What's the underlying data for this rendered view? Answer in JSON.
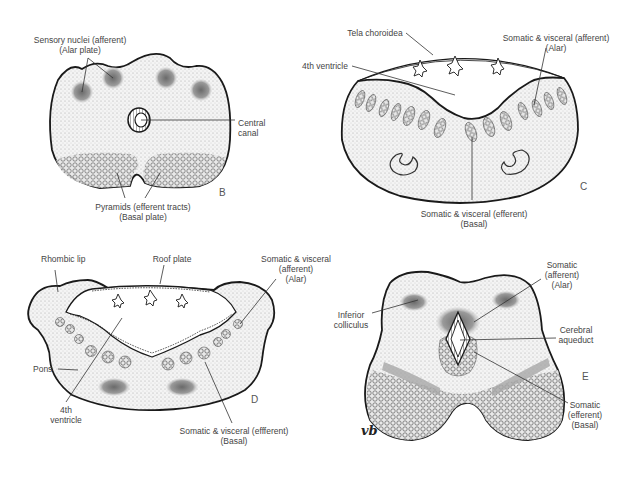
{
  "panels": {
    "B": {
      "letter": "B",
      "labels": {
        "sensory_line1": "Sensory nuclei (afferent)",
        "sensory_line2": "(Alar plate)",
        "central_line1": "Central",
        "central_line2": "canal",
        "pyramids_line1": "Pyramids (efferent tracts)",
        "pyramids_line2": "(Basal plate)"
      }
    },
    "C": {
      "letter": "C",
      "labels": {
        "tela": "Tela choroidea",
        "ventricle": "4th ventricle",
        "afferent_line1": "Somatic & visceral (afferent)",
        "afferent_line2": "(Alar)",
        "efferent_line1": "Somatic & visceral (efferent)",
        "efferent_line2": "(Basal)"
      }
    },
    "D": {
      "letter": "D",
      "labels": {
        "rhombic": "Rhombic lip",
        "roof": "Roof plate",
        "afferent_line1": "Somatic & visceral",
        "afferent_line2": "(afferent)",
        "afferent_line3": "(Alar)",
        "pons": "Pons",
        "ventricle_line1": "4th",
        "ventricle_line2": "ventricle",
        "efferent_line1": "Somatic & visceral (effferent)",
        "efferent_line2": "(Basal)"
      }
    },
    "E": {
      "letter": "E",
      "labels": {
        "afferent_line1": "Somatic",
        "afferent_line2": "(afferent)",
        "afferent_line3": "(Alar)",
        "colliculus_line1": "Inferior",
        "colliculus_line2": "colliculus",
        "aqueduct_line1": "Cerebral",
        "aqueduct_line2": "aqueduct",
        "efferent_line1": "Somatic",
        "efferent_line2": "(efferent)",
        "efferent_line3": "(Basal)"
      },
      "signature": "vb"
    }
  },
  "colors": {
    "outline": "#1a1a1a",
    "stipple_fill": "#f1f1f1",
    "nucleus_fill": "#8a8a8a",
    "leader_line": "#333333"
  }
}
